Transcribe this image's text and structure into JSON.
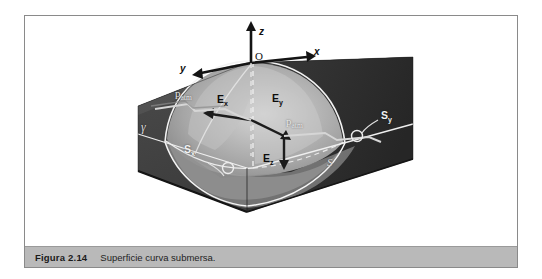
{
  "figure": {
    "caption_number": "Figura 2.14",
    "caption_text": "Superficie curva submersa.",
    "border_color": "#8a8a8a",
    "caption_bar_color": "#b9b9b9"
  },
  "diagram": {
    "kind": "3d-submerged-curved-surface",
    "axes": {
      "origin_label": "O",
      "z_label": "z",
      "x_label": "x",
      "y_label": "y"
    },
    "vectors": [
      {
        "key": "Ex",
        "base": "E",
        "sub": "x",
        "label": "Ex"
      },
      {
        "key": "Ey",
        "base": "E",
        "sub": "y",
        "label": "Ey"
      },
      {
        "key": "Ez",
        "base": "E",
        "sub": "z",
        "label": "Ez"
      }
    ],
    "pressure_labels": [
      {
        "key": "patm_left",
        "base": "p",
        "sub": "atm"
      },
      {
        "key": "patm_right",
        "base": "p",
        "sub": "atm"
      }
    ],
    "surface_labels": [
      {
        "key": "S",
        "base": "S",
        "sub": ""
      },
      {
        "key": "Sx",
        "base": "S",
        "sub": "x"
      },
      {
        "key": "Sy",
        "base": "S",
        "sub": "y"
      }
    ],
    "specific_weight_label": "γ",
    "colors": {
      "block_top_dark": "#3d3d3d",
      "block_left_face": "#4a4a4a",
      "block_right_face": "#2f2f2f",
      "dome_light": "#b5b5b5",
      "dome_mid": "#8f8f8f",
      "outline_white": "#f0f0f0",
      "axis_black": "#141414"
    }
  }
}
